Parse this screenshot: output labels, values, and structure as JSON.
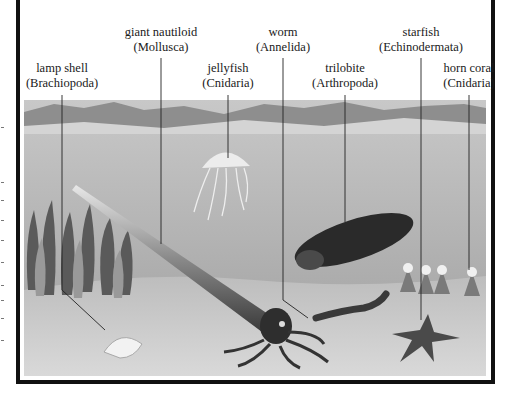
{
  "figure": {
    "labels": [
      {
        "id": "lamp-shell",
        "name": "lamp shell",
        "phylum": "(Brachiopoda)"
      },
      {
        "id": "giant-nautiloid",
        "name": "giant nautiloid",
        "phylum": "(Mollusca)"
      },
      {
        "id": "jellyfish",
        "name": "jellyfish",
        "phylum": "(Cnidaria)"
      },
      {
        "id": "worm",
        "name": "worm",
        "phylum": "(Annelida)"
      },
      {
        "id": "trilobite",
        "name": "trilobite",
        "phylum": "(Arthropoda)"
      },
      {
        "id": "starfish",
        "name": "starfish",
        "phylum": "(Echinodermata)"
      },
      {
        "id": "horn-coral",
        "name": "horn coral",
        "phylum": "(Cnidaria)"
      }
    ]
  },
  "colors": {
    "frame": "#111111",
    "sky": "#f2f2f2",
    "mountains": "#8e8e8e",
    "water": "#b9b9b9",
    "seabed": "#cfcfcf"
  }
}
